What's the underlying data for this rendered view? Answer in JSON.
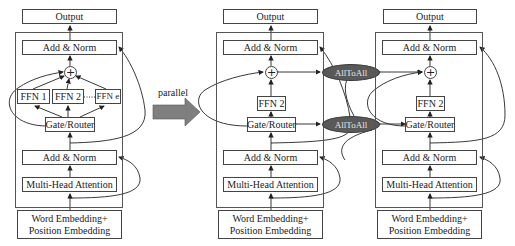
{
  "diagram": {
    "type": "moe-transformer-parallelism",
    "panels": [
      {
        "id": "single",
        "output": "Output",
        "add_norm_top": "Add & Norm",
        "experts": [
          "FFN 1",
          "FFN 2",
          "FFN e"
        ],
        "expert_dots": "......",
        "gate": "Gate/Router",
        "add_norm_bottom": "Add & Norm",
        "attention": "Multi-Head Attention",
        "embedding_line1": "Word Embedding+",
        "embedding_line2": "Position Embedding"
      },
      {
        "id": "device-1",
        "output": "Output",
        "add_norm_top": "Add & Norm",
        "experts": [
          "FFN 2"
        ],
        "gate": "Gate/Router",
        "add_norm_bottom": "Add & Norm",
        "attention": "Multi-Head Attention",
        "embedding_line1": "Word Embedding+",
        "embedding_line2": "Position Embedding"
      },
      {
        "id": "device-2",
        "output": "Output",
        "add_norm_top": "Add & Norm",
        "experts": [
          "FFN 2"
        ],
        "gate": "Gate/Router",
        "add_norm_bottom": "Add & Norm",
        "attention": "Multi-Head Attention",
        "embedding_line1": "Word Embedding+",
        "embedding_line2": "Position Embedding"
      }
    ],
    "comm": {
      "top": "AllToAll",
      "bottom": "AllToAll",
      "color": "#595959"
    },
    "transition": {
      "label": "parallel",
      "arrow_color": "#7f7f7f"
    },
    "sum_symbol": "+"
  }
}
